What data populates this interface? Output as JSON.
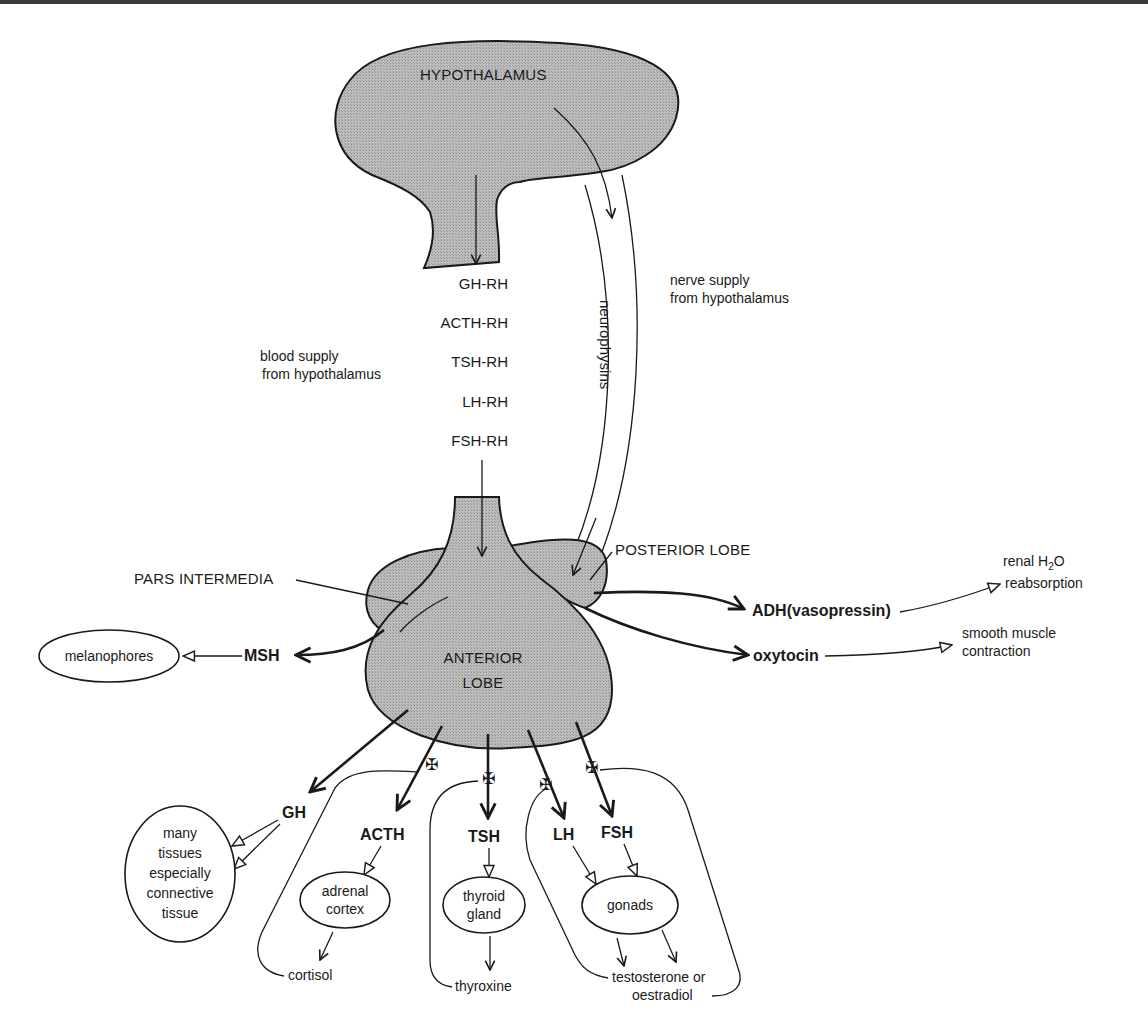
{
  "diagram": {
    "structures": {
      "hypothalamus": "HYPOTHALAMUS",
      "anterior_lobe_line1": "ANTERIOR",
      "anterior_lobe_line2": "LOBE",
      "posterior_lobe": "POSTERIOR LOBE",
      "pars_intermedia": "PARS INTERMEDIA",
      "neurophysins": "neurophysins"
    },
    "releasing_hormones": [
      "GH-RH",
      "ACTH-RH",
      "TSH-RH",
      "LH-RH",
      "FSH-RH"
    ],
    "supply_labels": {
      "blood_line1": "blood supply",
      "blood_line2": "from hypothalamus",
      "nerve_line1": "nerve supply",
      "nerve_line2": "from hypothalamus"
    },
    "posterior_hormones": {
      "adh": "ADH(vasopressin)",
      "oxytocin": "oxytocin",
      "adh_effect_line1": "renal H",
      "adh_effect_sub": "2",
      "adh_effect_o": "O",
      "adh_effect_line2": "reabsorption",
      "oxytocin_effect_line1": "smooth muscle",
      "oxytocin_effect_line2": "contraction"
    },
    "intermedia_hormone": {
      "msh": "MSH",
      "target": "melanophores"
    },
    "anterior_hormones": {
      "gh": "GH",
      "acth": "ACTH",
      "tsh": "TSH",
      "lh": "LH",
      "fsh": "FSH"
    },
    "targets": {
      "gh_target": [
        "many",
        "tissues",
        "especially",
        "connective",
        "tissue"
      ],
      "acth_target": [
        "adrenal",
        "cortex"
      ],
      "tsh_target": [
        "thyroid",
        "gland"
      ],
      "gonad_target": "gonads"
    },
    "feedback_products": {
      "cortisol": "cortisol",
      "thyroxine": "thyroxine",
      "sex_steroids_line1": "testosterone or",
      "sex_steroids_line2": "oestradiol"
    },
    "colors": {
      "tissue_fill": "#b8b8b8",
      "line": "#1a1a1a",
      "background": "#ffffff"
    }
  }
}
